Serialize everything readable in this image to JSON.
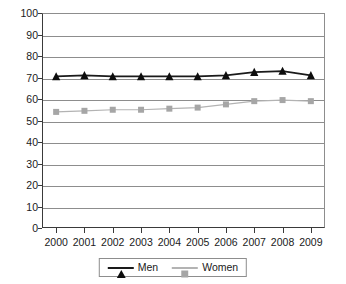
{
  "chart_data": {
    "type": "line",
    "title": "",
    "xlabel": "",
    "ylabel": "",
    "categories": [
      "2000",
      "2001",
      "2002",
      "2003",
      "2004",
      "2005",
      "2006",
      "2007",
      "2008",
      "2009"
    ],
    "series": [
      {
        "name": "Men",
        "color": "#1a1a1a",
        "marker": "triangle",
        "values": [
          70.5,
          71.0,
          70.5,
          70.5,
          70.5,
          70.5,
          71.0,
          72.5,
          73.0,
          71.0
        ]
      },
      {
        "name": "Women",
        "color": "#a6a6a6",
        "marker": "square",
        "values": [
          54.0,
          54.5,
          55.0,
          55.0,
          55.5,
          56.0,
          57.5,
          59.0,
          59.5,
          59.0
        ]
      }
    ],
    "ylim": [
      0,
      100
    ],
    "y_ticks": [
      0,
      10,
      20,
      30,
      40,
      50,
      60,
      70,
      80,
      90,
      100
    ],
    "y_tick_labels": [
      "0",
      "10",
      "20",
      "30",
      "40",
      "50",
      "60",
      "70",
      "80",
      "90",
      "100"
    ],
    "grid": true,
    "legend_position": "bottom-center"
  },
  "legend": {
    "entries": [
      {
        "label": "Men"
      },
      {
        "label": "Women"
      }
    ]
  }
}
